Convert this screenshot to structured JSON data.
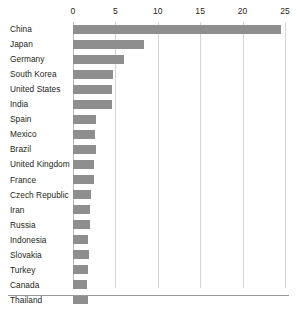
{
  "chart_data": {
    "type": "bar",
    "orientation": "horizontal",
    "title": "",
    "subtitle": "",
    "xlabel": "",
    "ylabel": "",
    "xlim": [
      0,
      25
    ],
    "xticks": [
      0,
      5,
      10,
      15,
      20,
      25
    ],
    "xtick_labels": [
      "0",
      "5",
      "10",
      "15",
      "20",
      "25"
    ],
    "grid": true,
    "grid_axis": "x",
    "legend": false,
    "legend_position": "none",
    "categories": [
      "China",
      "Japan",
      "Germany",
      "South Korea",
      "United States",
      "India",
      "Spain",
      "Mexico",
      "Brazil",
      "United Kingdom",
      "France",
      "Czech Republic",
      "Iran",
      "Russia",
      "Indonesia",
      "Slovakia",
      "Turkey",
      "Canada",
      "Thailand"
    ],
    "values": [
      24.5,
      8.4,
      6.0,
      4.7,
      4.6,
      4.6,
      2.7,
      2.6,
      2.7,
      2.5,
      2.5,
      2.1,
      2.0,
      2.0,
      1.8,
      1.9,
      1.8,
      1.7,
      1.8
    ],
    "bar_color": "#8e8e8e",
    "grid_color": "#d4d4d4",
    "axis_color": "#b9b9b9",
    "background_color": "#ffffff"
  }
}
